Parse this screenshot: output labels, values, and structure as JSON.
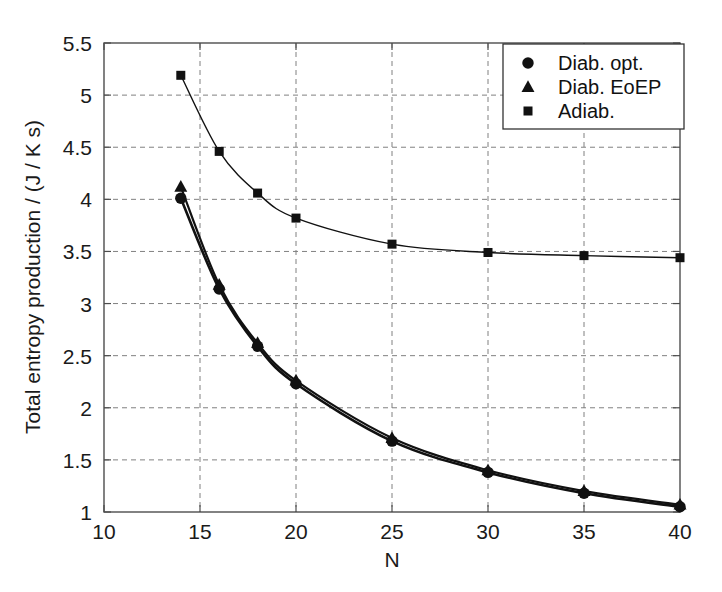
{
  "chart_data": {
    "type": "line",
    "title": "",
    "xlabel": "N",
    "ylabel": "Total entropy production / (J / K s)",
    "xlim": [
      10,
      40
    ],
    "ylim": [
      1,
      5.5
    ],
    "xticks": [
      "10",
      "15",
      "20",
      "25",
      "30",
      "35",
      "40"
    ],
    "yticks": [
      "1",
      "1.5",
      "2",
      "2.5",
      "3",
      "3.5",
      "4",
      "4.5",
      "5",
      "5.5"
    ],
    "grid": true,
    "legend_position": "top-right",
    "x": [
      14,
      16,
      18,
      20,
      25,
      30,
      35,
      40
    ],
    "series": [
      {
        "name": "Diab. opt.",
        "marker": "circle",
        "color": "#111111",
        "values": [
          4.01,
          3.14,
          2.59,
          2.23,
          1.68,
          1.38,
          1.18,
          1.05
        ]
      },
      {
        "name": "Diab. EoEP",
        "marker": "triangle",
        "color": "#111111",
        "values": [
          4.12,
          3.18,
          2.62,
          2.26,
          1.71,
          1.4,
          1.2,
          1.07
        ]
      },
      {
        "name": "Adiab.",
        "marker": "square",
        "color": "#111111",
        "values": [
          5.19,
          4.46,
          4.06,
          3.82,
          3.57,
          3.49,
          3.46,
          3.44
        ]
      }
    ]
  },
  "legend": {
    "entries": [
      {
        "label": "Diab. opt."
      },
      {
        "label": "Diab. EoEP"
      },
      {
        "label": "Adiab."
      }
    ]
  },
  "axes": {
    "x_title": "N",
    "y_title": "Total entropy production / (J / K s)"
  },
  "colors": {
    "line": "#111111",
    "grid": "#808080",
    "axis": "#4d4d4d",
    "background": "#ffffff"
  }
}
